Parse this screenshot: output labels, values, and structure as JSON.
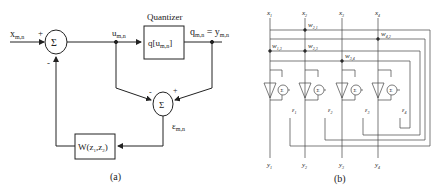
{
  "panel_a": {
    "caption": "(a)",
    "input_label": "x",
    "input_sub": "m,n",
    "sum1_symbol": "Σ",
    "sum1_plus": "+",
    "sum1_minus": "-",
    "u_label": "u",
    "u_sub": "m,n",
    "quantizer_title": "Quantizer",
    "quantizer_text": "q[u",
    "quantizer_sub": "m,n",
    "quantizer_close": "]",
    "q_label": "q",
    "q_sub": "m,n",
    "q_eq": " = y",
    "y_sub": "m,n",
    "sum2_symbol": "Σ",
    "sum2_minus": "-",
    "sum2_plus": "+",
    "e_label": "ε",
    "e_sub": "m,n",
    "filter_text": "W(z",
    "filter_sub1": "1",
    "filter_mid": ",z",
    "filter_sub2": "2",
    "filter_close": ")"
  },
  "panel_b": {
    "caption": "(b)",
    "inputs": [
      {
        "label": "x",
        "sub": "1"
      },
      {
        "label": "x",
        "sub": "2"
      },
      {
        "label": "x",
        "sub": "3"
      },
      {
        "label": "x",
        "sub": "4"
      }
    ],
    "outputs": [
      {
        "label": "y",
        "sub": "1"
      },
      {
        "label": "y",
        "sub": "2"
      },
      {
        "label": "y",
        "sub": "3"
      },
      {
        "label": "y",
        "sub": "4"
      }
    ],
    "weights": [
      {
        "label": "w",
        "sub": "2,1"
      },
      {
        "label": "w",
        "sub": "4,2"
      },
      {
        "label": "w",
        "sub": "1,3"
      },
      {
        "label": "w",
        "sub": "2,3"
      },
      {
        "label": "w",
        "sub": "3,4"
      }
    ],
    "errors": [
      {
        "label": "ε",
        "sub": "1"
      },
      {
        "label": "ε",
        "sub": "2"
      },
      {
        "label": "ε",
        "sub": "3"
      },
      {
        "label": "ε",
        "sub": "4"
      }
    ],
    "sum_symbol": "Σ"
  }
}
